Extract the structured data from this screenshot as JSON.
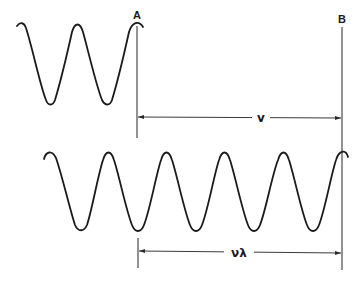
{
  "diagram": {
    "type": "wave-propagation-illustration",
    "markers": [
      {
        "id": "A",
        "label": "A"
      },
      {
        "id": "B",
        "label": "B"
      }
    ],
    "top_wave": {
      "label": "",
      "visible_crests": 3,
      "visible_troughs": 2
    },
    "bottom_wave": {
      "label": "",
      "visible_crests": 6,
      "visible_troughs": 5
    },
    "dimensions": {
      "velocity": {
        "label": "v",
        "from": "A",
        "to": "B"
      },
      "frequency_times_wavelength": {
        "label": "νλ",
        "from": "A",
        "to": "B"
      }
    },
    "colors": {
      "stroke": "#1a1a1a",
      "background": "#ffffff"
    }
  }
}
